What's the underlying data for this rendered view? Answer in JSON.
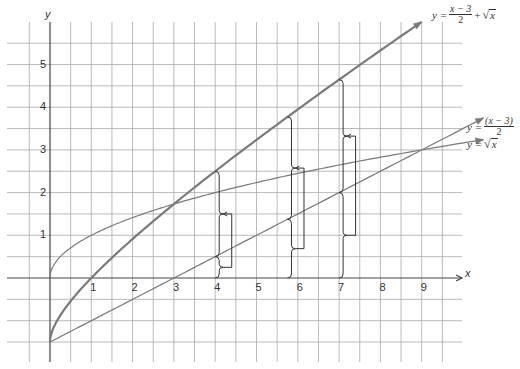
{
  "chart_data": {
    "type": "line",
    "title": "",
    "xlabel": "x",
    "ylabel": "y",
    "xlim": [
      -0.5,
      9.5
    ],
    "ylim": [
      -1.5,
      5.5
    ],
    "grid": true,
    "grid_step": 0.5,
    "x_ticks": [
      "1",
      "2",
      "3",
      "4",
      "5",
      "6",
      "7",
      "8",
      "9"
    ],
    "y_ticks": [
      "1",
      "2",
      "3",
      "4",
      "5"
    ],
    "series": [
      {
        "name": "y = (x - 3)/2 + √x",
        "label_parts": {
          "lhs": "y =",
          "num": "x − 3",
          "den": "2",
          "plus": "+",
          "rad": "x"
        },
        "style": "thick",
        "x": [
          0,
          0.25,
          0.5,
          1,
          2,
          3,
          4,
          5,
          6,
          7,
          8,
          9
        ],
        "values": [
          -1.5,
          -0.88,
          -0.54,
          0,
          0.91,
          1.73,
          2.5,
          3.24,
          3.95,
          4.65,
          5.33,
          6.0
        ]
      },
      {
        "name": "y = (x - 3)/2",
        "label_parts": {
          "lhs": "y =",
          "num": "(x − 3)",
          "den": "2"
        },
        "style": "thin",
        "x": [
          0,
          3,
          10.5
        ],
        "values": [
          -1.5,
          0,
          3.75
        ]
      },
      {
        "name": "y = √x",
        "label_parts": {
          "lhs": "y =",
          "rad": "x"
        },
        "style": "thin",
        "x": [
          0,
          1,
          2,
          3,
          4,
          6,
          8,
          10.5
        ],
        "values": [
          0,
          1,
          1.41,
          1.73,
          2,
          2.45,
          2.83,
          3.24
        ]
      }
    ],
    "annotations": [
      {
        "type": "bracket-sum",
        "x": 4,
        "desc": "braces showing √x and (x-3)/2 adding to the sum curve"
      },
      {
        "type": "bracket-sum",
        "x": 5.75,
        "desc": "braces showing √x and (x-3)/2 adding to the sum curve"
      },
      {
        "type": "bracket-sum",
        "x": 7,
        "desc": "braces showing √x and (x-3)/2 adding to the sum curve"
      }
    ]
  },
  "axes": {
    "x_name": "x",
    "y_name": "y"
  },
  "colors": {
    "grid": "#9a9a9a",
    "axis": "#444444",
    "curve": "#7a7a7a",
    "bracket": "#333333"
  }
}
